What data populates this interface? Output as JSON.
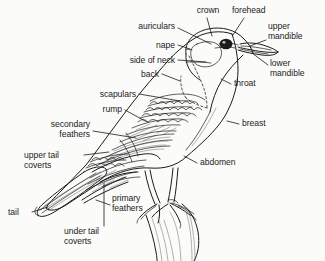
{
  "figure": {
    "background_color": "#fbfbfa",
    "ink_color": "#1b1b1b",
    "width": 325,
    "height": 261
  },
  "labels": [
    {
      "id": "crown",
      "text": "crown",
      "lines": [
        "crown"
      ],
      "align": "center",
      "x": 186,
      "y": 6,
      "w": 44
    },
    {
      "id": "forehead",
      "text": "forehead",
      "lines": [
        "forehead"
      ],
      "align": "left",
      "x": 232,
      "y": 6,
      "w": 50
    },
    {
      "id": "auriculars",
      "text": "auriculars",
      "lines": [
        "auriculars"
      ],
      "align": "right",
      "x": 123,
      "y": 22,
      "w": 52
    },
    {
      "id": "upper-mandible",
      "text": "upper mandible",
      "lines": [
        "upper",
        "mandible"
      ],
      "align": "left",
      "x": 268,
      "y": 22,
      "w": 55
    },
    {
      "id": "nape",
      "text": "nape",
      "lines": [
        "nape"
      ],
      "align": "right",
      "x": 126,
      "y": 41,
      "w": 49
    },
    {
      "id": "side-of-neck",
      "text": "side of neck",
      "lines": [
        "side of neck"
      ],
      "align": "right",
      "x": 108,
      "y": 56,
      "w": 67
    },
    {
      "id": "lower-mandible",
      "text": "lower mandible",
      "lines": [
        "lower",
        "mandible"
      ],
      "align": "left",
      "x": 270,
      "y": 59,
      "w": 55
    },
    {
      "id": "back",
      "text": "back",
      "lines": [
        "back"
      ],
      "align": "right",
      "x": 113,
      "y": 70,
      "w": 46
    },
    {
      "id": "throat",
      "text": "throat",
      "lines": [
        "throat"
      ],
      "align": "left",
      "x": 232,
      "y": 79,
      "w": 40
    },
    {
      "id": "scapulars",
      "text": "scapulars",
      "lines": [
        "scapulars"
      ],
      "align": "right",
      "x": 74,
      "y": 90,
      "w": 62
    },
    {
      "id": "rump",
      "text": "rump",
      "lines": [
        "rump"
      ],
      "align": "right",
      "x": 72,
      "y": 105,
      "w": 50
    },
    {
      "id": "breast",
      "text": "breast",
      "lines": [
        "breast"
      ],
      "align": "left",
      "x": 240,
      "y": 119,
      "w": 40
    },
    {
      "id": "secondary-feathers",
      "text": "secondary feathers",
      "lines": [
        "secondary",
        "feathers"
      ],
      "align": "right",
      "x": 18,
      "y": 120,
      "w": 72
    },
    {
      "id": "upper-tail-coverts",
      "text": "upper tail coverts",
      "lines": [
        "upper tail",
        "coverts"
      ],
      "align": "left",
      "x": 24,
      "y": 151,
      "w": 56
    },
    {
      "id": "abdomen",
      "text": "abdomen",
      "lines": [
        "abdomen"
      ],
      "align": "left",
      "x": 198,
      "y": 158,
      "w": 50
    },
    {
      "id": "primary-feathers",
      "text": "primary feathers",
      "lines": [
        "primary",
        "feathers"
      ],
      "align": "left",
      "x": 112,
      "y": 194,
      "w": 50
    },
    {
      "id": "tail",
      "text": "tail",
      "lines": [
        "tail"
      ],
      "align": "left",
      "x": 8,
      "y": 208,
      "w": 22
    },
    {
      "id": "under-tail-coverts",
      "text": "under tail coverts",
      "lines": [
        "under tail",
        "coverts"
      ],
      "align": "left",
      "x": 64,
      "y": 227,
      "w": 58
    }
  ],
  "leaders": [
    {
      "id": "crown",
      "d": "M 207 18 L 212 36"
    },
    {
      "id": "forehead",
      "d": "M 244 18 L 233 35"
    },
    {
      "id": "auriculars",
      "d": "M 178 28 L 211 44"
    },
    {
      "id": "upper-mandible",
      "d": "M 266 40 L 250 46"
    },
    {
      "id": "nape",
      "d": "M 178 45 L 190 49"
    },
    {
      "id": "side-of-neck",
      "d": "M 178 60 L 204 62"
    },
    {
      "id": "lower-mandible",
      "d": "M 268 65 L 252 53"
    },
    {
      "id": "back",
      "d": "M 162 74 L 178 80"
    },
    {
      "id": "throat",
      "d": "M 231 84 L 222 80"
    },
    {
      "id": "scapulars",
      "d": "M 139 94 L 178 100"
    },
    {
      "id": "rump",
      "d": "M 125 110 L 148 121"
    },
    {
      "id": "breast",
      "d": "M 239 124 L 228 122"
    },
    {
      "id": "secondary-feathers",
      "d": "M 93 131 L 135 137"
    },
    {
      "id": "upper-tail-coverts",
      "d": "M 84 155 L 108 152"
    },
    {
      "id": "abdomen",
      "d": "M 197 163 L 185 157"
    },
    {
      "id": "primary-feathers",
      "d": "M 110 205 L 97 200"
    },
    {
      "id": "tail",
      "d": "M 32 212 L 48 207"
    },
    {
      "id": "under-tail-coverts",
      "d": "M 104 225 L 104 182"
    }
  ],
  "parts_drawn": [
    "head",
    "eye",
    "bill",
    "auricular-patch",
    "nape-line",
    "neck-line",
    "back",
    "scapular-feathers",
    "wing-coverts",
    "secondary-feathers",
    "primary-feathers",
    "rump",
    "upper-tail-coverts",
    "tail",
    "under-tail-coverts",
    "throat",
    "breast",
    "abdomen",
    "legs",
    "feet",
    "perch-branch"
  ]
}
